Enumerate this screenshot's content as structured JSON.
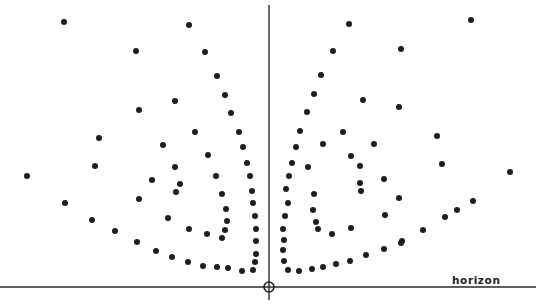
{
  "diagram": {
    "title": "",
    "labels": {
      "horizon": "horizon"
    },
    "colors": {
      "ink": "#1e1e1e",
      "background": "#ffffff"
    },
    "elements": [
      "horizon-line",
      "vertical-axis",
      "origin-marker",
      "point-pattern"
    ]
  }
}
